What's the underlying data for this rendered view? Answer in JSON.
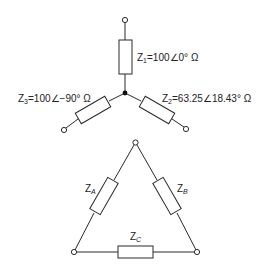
{
  "star_network": {
    "z1": {
      "symbol": "Z",
      "sub": "1",
      "value": "=100∠0° Ω"
    },
    "z2": {
      "symbol": "Z",
      "sub": "2",
      "value": "=63.25∠18.43° Ω"
    },
    "z3": {
      "symbol": "Z",
      "sub": "3",
      "value": "=100∠−90° Ω"
    }
  },
  "delta_network": {
    "za": {
      "symbol": "Z",
      "sub": "A"
    },
    "zb": {
      "symbol": "Z",
      "sub": "B"
    },
    "zc": {
      "symbol": "Z",
      "sub": "C"
    }
  }
}
